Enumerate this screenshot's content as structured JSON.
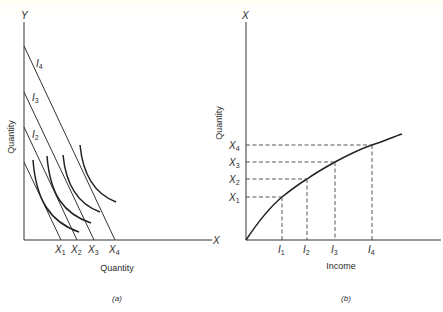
{
  "panel_a": {
    "y_axis_label": "Y",
    "x_axis_label": "X",
    "y_title": "Quantity",
    "x_title": "Quantity",
    "caption": "(a)",
    "budget_lines": [
      {
        "name": "I",
        "sub": "1"
      },
      {
        "name": "I",
        "sub": "2"
      },
      {
        "name": "I",
        "sub": "3"
      },
      {
        "name": "I",
        "sub": "4"
      }
    ],
    "x_ticks": [
      {
        "name": "X",
        "sub": "1"
      },
      {
        "name": "X",
        "sub": "2"
      },
      {
        "name": "X",
        "sub": "3"
      },
      {
        "name": "X",
        "sub": "4"
      }
    ]
  },
  "panel_b": {
    "y_axis_label": "X",
    "y_title": "Quantity",
    "x_title": "Income",
    "caption": "(b)",
    "y_ticks": [
      {
        "name": "X",
        "sub": "1"
      },
      {
        "name": "X",
        "sub": "2"
      },
      {
        "name": "X",
        "sub": "3"
      },
      {
        "name": "X",
        "sub": "4"
      }
    ],
    "x_ticks": [
      {
        "name": "I",
        "sub": "1"
      },
      {
        "name": "I",
        "sub": "2"
      },
      {
        "name": "I",
        "sub": "3"
      },
      {
        "name": "I",
        "sub": "4"
      }
    ]
  },
  "colors": {
    "ink": "#222222",
    "background": "#ffffff"
  }
}
